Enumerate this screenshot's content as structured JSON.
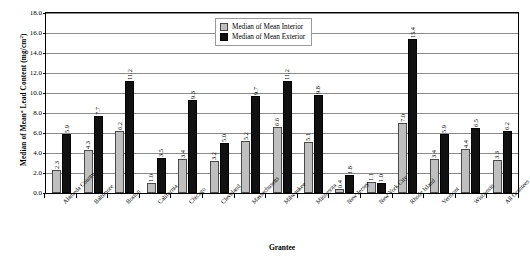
{
  "chart_data": {
    "type": "bar",
    "title": "",
    "xlabel": "Grantee",
    "ylabel": "Median of Mean² Lead Content (mg/cm²)",
    "ylim": [
      0.0,
      18.0
    ],
    "ytick_step": 2.0,
    "ytick_labels": [
      "0.0",
      "2.0",
      "4.0",
      "6.0",
      "8.0",
      "10.0",
      "12.0",
      "14.0",
      "16.0",
      "18.0"
    ],
    "grid": true,
    "legend_position": "top-center",
    "categories": [
      "Alameda County",
      "Baltimore",
      "Boston",
      "California",
      "Chicago",
      "Cleveland",
      "Massachusetts",
      "Milwaukee",
      "Minnesota",
      "New Jersey",
      "New York City",
      "Rhode Island",
      "Vermont",
      "Wisconsin",
      "All Grantees"
    ],
    "series": [
      {
        "name": "Median of Mean Interior",
        "color": "#bfbfbf",
        "values": [
          2.3,
          4.3,
          6.2,
          1.0,
          3.4,
          3.2,
          5.2,
          6.6,
          5.1,
          0.4,
          1.1,
          7.0,
          3.4,
          4.4,
          3.3
        ]
      },
      {
        "name": "Median of Mean Exterior",
        "color": "#111111",
        "values": [
          5.9,
          7.7,
          11.2,
          3.5,
          9.3,
          5.0,
          9.7,
          11.2,
          9.8,
          1.8,
          1.0,
          15.4,
          5.9,
          6.5,
          6.2
        ]
      }
    ]
  },
  "legend": {
    "items": [
      {
        "label": "Median of Mean Interior"
      },
      {
        "label": "Median of Mean Exterior"
      }
    ]
  },
  "axis": {
    "y_title_main": "Median of Mean",
    "y_title_sup": "a",
    "y_title_rest": " Lead Content (mg/cm",
    "y_title_sup2": "2",
    "y_title_end": ")",
    "x_title": "Grantee"
  }
}
